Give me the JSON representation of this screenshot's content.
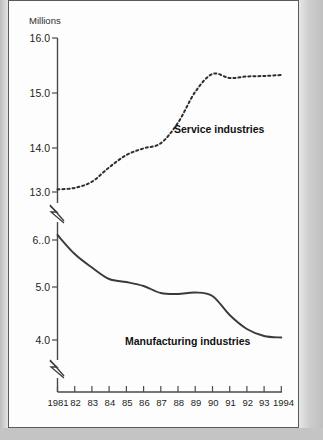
{
  "axis": {
    "unit_label": "Millions",
    "y_upper_ticks": [
      "16.0",
      "15.0",
      "14.0",
      "13.0"
    ],
    "y_lower_ticks": [
      "6..0",
      "5.0",
      "4.0"
    ],
    "x_ticks": [
      "1981",
      "82",
      "83",
      "84",
      "85",
      "86",
      "87",
      "88",
      "89",
      "90",
      "91",
      "92",
      "93",
      "1994"
    ]
  },
  "series_labels": {
    "service": "Service industries",
    "manufacturing": "Manufacturing industries"
  },
  "colors": {
    "ink": "#2e2e2e",
    "axis": "#4a4a4a",
    "paper": "#fdfdfd",
    "page": "#c9c9c9"
  },
  "chart_data": {
    "type": "line",
    "title": "",
    "xlabel": "",
    "ylabel": "Millions",
    "grid": false,
    "legend": "inline-annotations",
    "x": [
      1981,
      1982,
      1983,
      1984,
      1985,
      1986,
      1987,
      1988,
      1989,
      1990,
      1991,
      1992,
      1993,
      1994
    ],
    "x_tick_labels": [
      "1981",
      "82",
      "83",
      "84",
      "85",
      "86",
      "87",
      "88",
      "89",
      "90",
      "91",
      "92",
      "93",
      "1994"
    ],
    "y_axis_note": "Broken y-axis: upper segment 13.0-16.0 for service industries, lower segment 4.0-6.0 for manufacturing industries",
    "y_upper_range": [
      13.0,
      16.0
    ],
    "y_lower_range": [
      4.0,
      6.0
    ],
    "series": [
      {
        "name": "Service industries",
        "style": "dotted",
        "axis_segment": "upper",
        "values": [
          13.05,
          13.08,
          13.2,
          13.48,
          13.72,
          13.85,
          13.95,
          14.35,
          14.95,
          15.3,
          15.22,
          15.25,
          15.26,
          15.28
        ]
      },
      {
        "name": "Manufacturing industries",
        "style": "solid",
        "axis_segment": "lower",
        "values": [
          6.1,
          5.72,
          5.45,
          5.22,
          5.16,
          5.08,
          4.94,
          4.92,
          4.95,
          4.88,
          4.5,
          4.22,
          4.08,
          4.05
        ]
      }
    ]
  }
}
